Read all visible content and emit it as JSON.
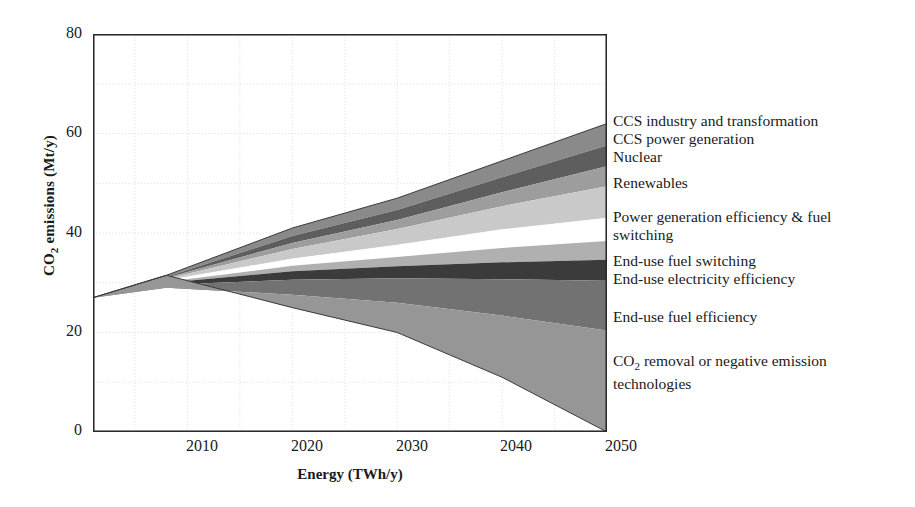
{
  "chart_data": {
    "type": "area",
    "title": "",
    "subtitle": "",
    "xlabel": "Energy (TWh/y)",
    "ylabel_html": "CO<sub>2</sub> emissions (Mt/y)",
    "ylabel_text": "CO2 emissions (Mt/y)",
    "xlim": [
      2001,
      2050
    ],
    "ylim": [
      0,
      80
    ],
    "xticks": [
      2010,
      2020,
      2030,
      2040,
      2050
    ],
    "yticks": [
      0,
      20,
      40,
      60,
      80
    ],
    "grid": true,
    "grid_minor_step": 10,
    "legend_position": "right-inline",
    "stacking": "wedge-from-baseline",
    "x": [
      2001,
      2008,
      2020,
      2030,
      2040,
      2050
    ],
    "baseline_series": {
      "name": "Baseline emissions (top of wedge stack)",
      "values": [
        27,
        31.5,
        41,
        47,
        54.5,
        62
      ]
    },
    "remaining_series": {
      "name": "Remaining CO2 emissions (bottom of wedge stack)",
      "values": [
        27,
        31.5,
        25,
        20,
        11,
        0
      ]
    },
    "series": [
      {
        "name": "CCS industry and transformation",
        "color": "#8a8a8a",
        "top": [
          27,
          31.5,
          41,
          47,
          54.5,
          62
        ],
        "bottom": [
          27,
          31.2,
          39.4,
          44.6,
          51.2,
          57.6
        ],
        "values_2050": 4.4
      },
      {
        "name": "CCS power generation",
        "color": "#5e5e5e",
        "top": [
          27,
          31.2,
          39.4,
          44.6,
          51.2,
          57.6
        ],
        "bottom": [
          27,
          31.0,
          38.0,
          42.6,
          48.2,
          53.4
        ],
        "values_2050": 4.2
      },
      {
        "name": "Nuclear",
        "color": "#9d9d9d",
        "top": [
          27,
          31.0,
          38.0,
          42.6,
          48.2,
          53.4
        ],
        "bottom": [
          27,
          30.8,
          36.8,
          40.8,
          45.4,
          49.4
        ],
        "values_2050": 4.0
      },
      {
        "name": "Renewables",
        "color": "#c9c9c9",
        "top": [
          27,
          30.8,
          36.8,
          40.8,
          45.4,
          49.4
        ],
        "bottom": [
          27,
          30.5,
          34.8,
          37.6,
          40.7,
          43.0
        ],
        "values_2050": 6.4
      },
      {
        "name": "Power generation efficiency & fuel switching",
        "color": "#ffffff",
        "top": [
          27,
          30.5,
          34.8,
          37.6,
          40.7,
          43.0
        ],
        "bottom": [
          27,
          30.2,
          33.4,
          35.2,
          37.0,
          38.4
        ],
        "values_2050": 4.6
      },
      {
        "name": "End-use fuel switching",
        "color": "#b0b0b0",
        "top": [
          27,
          30.2,
          33.4,
          35.2,
          37.0,
          38.4
        ],
        "bottom": [
          27,
          30.0,
          32.3,
          33.3,
          34.1,
          34.6
        ],
        "values_2050": 3.8
      },
      {
        "name": "End-use electricity efficiency",
        "color": "#3b3b3b",
        "top": [
          27,
          30.0,
          32.3,
          33.3,
          34.1,
          34.6
        ],
        "bottom": [
          27,
          29.6,
          30.6,
          30.9,
          30.7,
          30.4
        ],
        "values_2050": 4.2
      },
      {
        "name": "End-use fuel efficiency",
        "color": "#727272",
        "top": [
          27,
          29.6,
          30.6,
          30.9,
          30.7,
          30.4
        ],
        "bottom": [
          27,
          29.0,
          27.6,
          26.0,
          23.4,
          20.4
        ],
        "values_2050": 10.0
      },
      {
        "name": "CO2 removal or negative emission technologies",
        "color": "#969696",
        "top": [
          27,
          29.0,
          27.6,
          26.0,
          23.4,
          20.4
        ],
        "bottom": [
          27,
          31.5,
          25.0,
          20.0,
          11.0,
          0.0
        ],
        "values_2050": 20.4
      }
    ]
  },
  "axes": {
    "ylabel_prefix": "CO",
    "ylabel_sub": "2",
    "ylabel_suffix": " emissions (Mt/y)",
    "xlabel": "Energy (TWh/y)",
    "ytick_labels": [
      "80",
      "60",
      "40",
      "20",
      "0"
    ],
    "xtick_labels": [
      "2010",
      "2020",
      "2030",
      "2040",
      "2050"
    ]
  },
  "legend": {
    "items": [
      {
        "label": "CCS industry and transformation",
        "top": 0
      },
      {
        "label": "CCS power generation",
        "top": 18
      },
      {
        "label": "Nuclear",
        "top": 36
      },
      {
        "label": "Renewables",
        "top": 62
      },
      {
        "label": "Power generation efficiency & fuel\nswitching",
        "top": 96
      },
      {
        "label": "End-use fuel switching",
        "top": 140
      },
      {
        "label": "End-use electricity efficiency",
        "top": 158
      },
      {
        "label": "End-use fuel efficiency",
        "top": 196
      },
      {
        "label_prefix": "CO",
        "label_sub": "2",
        "label_suffix": " removal or negative emission\ntechnologies",
        "label": "CO2 removal or negative emission\ntechnologies",
        "top": 240
      }
    ]
  }
}
